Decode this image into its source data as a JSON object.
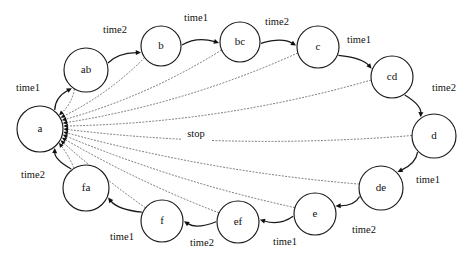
{
  "diagram": {
    "canvas": {
      "width": 474,
      "height": 262
    },
    "colors": {
      "background": "#ffffff",
      "node_stroke": "#1a1a1a",
      "node_fill": "#ffffff",
      "solid_edge": "#1a1a1a",
      "dotted_edge": "#4a4a4a",
      "text": "#111111"
    },
    "nodes": [
      {
        "id": "a",
        "label": "a",
        "cx": 40,
        "cy": 129,
        "r": 23
      },
      {
        "id": "ab",
        "label": "ab",
        "cx": 86,
        "cy": 70,
        "r": 22
      },
      {
        "id": "b",
        "label": "b",
        "cx": 161,
        "cy": 46,
        "r": 20
      },
      {
        "id": "bc",
        "label": "bc",
        "cx": 240,
        "cy": 42,
        "r": 20
      },
      {
        "id": "c",
        "label": "c",
        "cx": 318,
        "cy": 47,
        "r": 21
      },
      {
        "id": "cd",
        "label": "cd",
        "cx": 392,
        "cy": 77,
        "r": 21
      },
      {
        "id": "d",
        "label": "d",
        "cx": 434,
        "cy": 136,
        "r": 22
      },
      {
        "id": "de",
        "label": "de",
        "cx": 381,
        "cy": 188,
        "r": 22
      },
      {
        "id": "e",
        "label": "e",
        "cx": 315,
        "cy": 214,
        "r": 21
      },
      {
        "id": "ef",
        "label": "ef",
        "cx": 238,
        "cy": 222,
        "r": 21
      },
      {
        "id": "f",
        "label": "f",
        "cx": 162,
        "cy": 221,
        "r": 21
      },
      {
        "id": "fa",
        "label": "fa",
        "cx": 86,
        "cy": 188,
        "r": 23
      }
    ],
    "transitions": [
      {
        "from": "a",
        "to": "ab",
        "label": "time1",
        "label_x": 28,
        "label_y": 89
      },
      {
        "from": "ab",
        "to": "b",
        "label": "time2",
        "label_x": 115,
        "label_y": 31
      },
      {
        "from": "b",
        "to": "bc",
        "label": "time1",
        "label_x": 196,
        "label_y": 19
      },
      {
        "from": "bc",
        "to": "c",
        "label": "time2",
        "label_x": 277,
        "label_y": 23
      },
      {
        "from": "c",
        "to": "cd",
        "label": "time1",
        "label_x": 359,
        "label_y": 41
      },
      {
        "from": "cd",
        "to": "d",
        "label": "time2",
        "label_x": 444,
        "label_y": 89
      },
      {
        "from": "d",
        "to": "de",
        "label": "time1",
        "label_x": 428,
        "label_y": 181
      },
      {
        "from": "de",
        "to": "e",
        "label": "time2",
        "label_x": 364,
        "label_y": 231
      },
      {
        "from": "e",
        "to": "ef",
        "label": "time1",
        "label_x": 285,
        "label_y": 243
      },
      {
        "from": "ef",
        "to": "f",
        "label": "time2",
        "label_x": 202,
        "label_y": 244
      },
      {
        "from": "f",
        "to": "fa",
        "label": "time1",
        "label_x": 122,
        "label_y": 238
      },
      {
        "from": "fa",
        "to": "a",
        "label": "time2",
        "label_x": 33,
        "label_y": 176
      }
    ],
    "stop_transitions": {
      "label": "stop",
      "label_x": 196,
      "label_y": 135,
      "target": "a",
      "sources": [
        "ab",
        "b",
        "bc",
        "c",
        "cd",
        "d",
        "de",
        "e",
        "ef",
        "f",
        "fa"
      ]
    }
  }
}
